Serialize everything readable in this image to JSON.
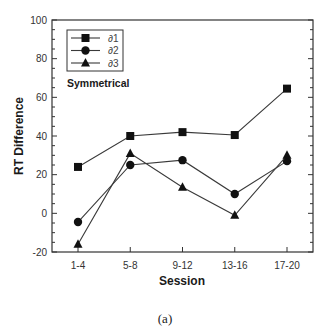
{
  "chart_data": {
    "type": "line",
    "title": "",
    "annotation": "Symmetrical",
    "caption": "(a)",
    "xlabel": "Session",
    "ylabel": "RT Difference",
    "categories": [
      "1-4",
      "5-8",
      "9-12",
      "13-16",
      "17-20"
    ],
    "ylim": [
      -20,
      100
    ],
    "yticks": [
      -20,
      0,
      20,
      40,
      60,
      80,
      100
    ],
    "y_minor_step": 5,
    "grid": false,
    "legend_position": "upper-left",
    "series": [
      {
        "name": "∂1",
        "marker": "square",
        "values": [
          24,
          40,
          42,
          40.5,
          64.5
        ]
      },
      {
        "name": "∂2",
        "marker": "circle",
        "values": [
          -4.5,
          25,
          27.5,
          10,
          27
        ]
      },
      {
        "name": "∂3",
        "marker": "triangle",
        "values": [
          -16,
          31,
          13.5,
          -1,
          30
        ]
      }
    ]
  },
  "colors": {
    "line": "#3a3a3a",
    "marker": "#111111",
    "frame": "#333333"
  }
}
